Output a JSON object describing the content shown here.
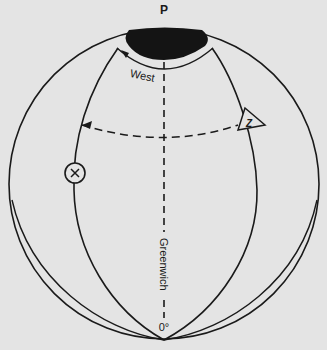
{
  "diagram": {
    "pole_label": "P",
    "west_label": "West",
    "meridian_label": "Greenwich",
    "meridian_degree": "0°",
    "marker_x_label": "X",
    "marker_z_label": "Z",
    "colors": {
      "background": "#e4e4e4",
      "ink": "#1a1a1a",
      "polar_cap": "#141414"
    }
  }
}
